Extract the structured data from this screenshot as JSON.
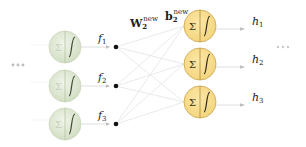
{
  "diagram": {
    "type": "neural-network-layer",
    "left_ellipsis": "···",
    "right_ellipsis": "···",
    "weight_label": {
      "base": "W",
      "sub": "2",
      "sup": "new"
    },
    "bias_label": {
      "base": "b",
      "sub": "2",
      "sup": "new"
    },
    "input_nodes": [
      {
        "sum": "Σ",
        "feature": "f",
        "sub": "1"
      },
      {
        "sum": "Σ",
        "feature": "f",
        "sub": "2"
      },
      {
        "sum": "Σ",
        "feature": "f",
        "sub": "3"
      }
    ],
    "output_nodes": [
      {
        "sum": "Σ",
        "output": "h",
        "sub": "1"
      },
      {
        "sum": "Σ",
        "output": "h",
        "sub": "2"
      },
      {
        "sum": "Σ",
        "output": "h",
        "sub": "3"
      }
    ],
    "colors": {
      "input_node_fill": "#dfe8d2",
      "input_node_stroke": "#c7d3b8",
      "output_node_fill": "#f7dc8c",
      "output_node_stroke": "#d1ad5a",
      "edge": "#e6e6e6",
      "dot": "#111111"
    }
  }
}
